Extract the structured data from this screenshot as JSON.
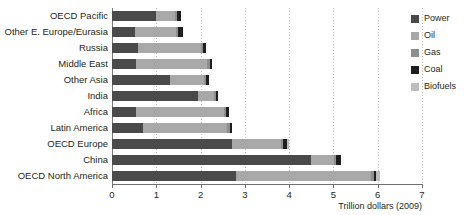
{
  "chart_data": {
    "type": "bar",
    "orientation": "horizontal",
    "stacked": true,
    "title": "",
    "xlabel": "Trillion dollars (2009)",
    "ylabel": "",
    "xlim": [
      0,
      7
    ],
    "xticks": [
      0,
      1,
      2,
      3,
      4,
      5,
      6,
      7
    ],
    "xtick_labels": [
      "0",
      "1",
      "2",
      "3",
      "4",
      "5",
      "6",
      "7"
    ],
    "grid": true,
    "grid_axis": "x",
    "legend_position": "right",
    "categories": [
      "OECD Pacific",
      "Other E. Europe/Eurasia",
      "Russia",
      "Middle East",
      "Other Asia",
      "India",
      "Africa",
      "Latin America",
      "OECD Europe",
      "China",
      "OECD North America"
    ],
    "series": [
      {
        "name": "Power",
        "color": "#4a4a4a",
        "values": [
          1.0,
          0.52,
          0.58,
          0.55,
          1.3,
          1.95,
          0.55,
          0.7,
          2.7,
          4.5,
          2.8
        ]
      },
      {
        "name": "Oil",
        "color": "#a8a8a8",
        "values": [
          0.42,
          0.92,
          1.42,
          1.6,
          0.78,
          0.36,
          1.98,
          1.9,
          1.12,
          0.52,
          3.05
        ]
      },
      {
        "name": "Gas",
        "color": "#8e8e8e",
        "values": [
          0.05,
          0.06,
          0.06,
          0.06,
          0.05,
          0.04,
          0.05,
          0.06,
          0.05,
          0.04,
          0.06
        ]
      },
      {
        "name": "Coal",
        "color": "#1f1f1f",
        "values": [
          0.08,
          0.1,
          0.06,
          0.04,
          0.07,
          0.05,
          0.07,
          0.06,
          0.08,
          0.12,
          0.06
        ]
      },
      {
        "name": "Biofuels",
        "color": "#bdbdbd",
        "values": [
          0.0,
          0.0,
          0.0,
          0.0,
          0.0,
          0.0,
          0.0,
          0.0,
          0.05,
          0.0,
          0.08
        ]
      }
    ],
    "totals": [
      1.55,
      1.6,
      2.12,
      2.25,
      2.2,
      2.4,
      2.65,
      2.72,
      4.0,
      5.18,
      6.05
    ]
  },
  "legend": {
    "items": [
      {
        "label": "Power",
        "color": "#4a4a4a"
      },
      {
        "label": "Oil",
        "color": "#a8a8a8"
      },
      {
        "label": "Gas",
        "color": "#8e8e8e"
      },
      {
        "label": "Coal",
        "color": "#1f1f1f"
      },
      {
        "label": "Biofuels",
        "color": "#bdbdbd"
      }
    ]
  }
}
